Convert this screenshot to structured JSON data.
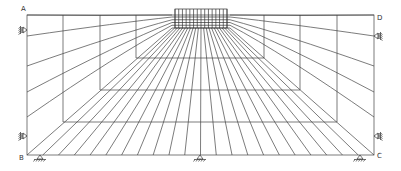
{
  "diagram": {
    "type": "finite-element-mesh",
    "corner_labels": {
      "A": "A",
      "B": "B",
      "C": "C",
      "D": "D"
    },
    "colors": {
      "line": "#444444",
      "background": "#ffffff",
      "label": "#333333"
    },
    "boundary": {
      "left": 27,
      "right": 374,
      "top": 15,
      "bottom": 155
    },
    "nested_boxes": [
      {
        "left": 136,
        "right": 264,
        "bottom": 58
      },
      {
        "left": 100,
        "right": 300,
        "bottom": 90
      },
      {
        "left": 63,
        "right": 337,
        "bottom": 122
      }
    ],
    "load_block": {
      "left": 172,
      "right": 230,
      "top": 9,
      "bottom": 28,
      "hatch_count": 14
    },
    "fan_rays": 22,
    "side_rays": 4,
    "supports": {
      "left_rollers": [
        {
          "x": 27,
          "y": 30,
          "icon": "roller-support-icon"
        },
        {
          "x": 27,
          "y": 136,
          "icon": "roller-support-icon"
        }
      ],
      "right_rollers": [
        {
          "x": 374,
          "y": 36,
          "icon": "roller-support-icon"
        },
        {
          "x": 374,
          "y": 136,
          "icon": "roller-support-icon"
        }
      ],
      "bottom_pins": [
        {
          "x": 40,
          "y": 155,
          "icon": "pin-support-icon"
        },
        {
          "x": 200,
          "y": 155,
          "icon": "pin-support-icon"
        },
        {
          "x": 360,
          "y": 155,
          "icon": "pin-support-icon"
        }
      ]
    }
  }
}
